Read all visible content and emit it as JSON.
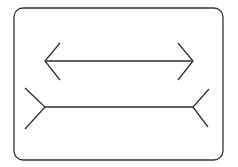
{
  "figure": {
    "type": "muller-lyer-illusion",
    "stroke_color": "#333333",
    "background": "#ffffff",
    "frame": {
      "x": 14,
      "y": 8,
      "width": 209,
      "height": 152,
      "rx": 9
    },
    "top_line": {
      "label": "arrowheads-inward",
      "shaft": {
        "x1": 45,
        "y1": 61,
        "x2": 193,
        "y2": 61
      },
      "left_fins": [
        [
          60,
          43
        ],
        [
          45,
          61
        ],
        [
          60,
          80
        ]
      ],
      "right_fins": [
        [
          178,
          43
        ],
        [
          193,
          61
        ],
        [
          178,
          80
        ]
      ]
    },
    "bottom_line": {
      "label": "fins-outward",
      "shaft": {
        "x1": 45,
        "y1": 107,
        "x2": 193,
        "y2": 107
      },
      "left_fins": [
        [
          25,
          88
        ],
        [
          45,
          107
        ],
        [
          25,
          129
        ]
      ],
      "right_fins": [
        [
          209,
          89
        ],
        [
          193,
          107
        ],
        [
          208,
          127
        ]
      ]
    }
  }
}
